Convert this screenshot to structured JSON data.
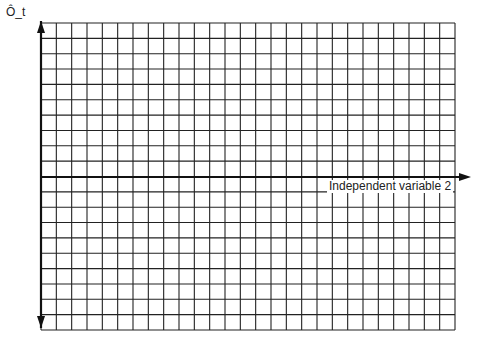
{
  "diagram": {
    "type": "blank-graph-grid",
    "grid": {
      "left": 41,
      "top": 23,
      "right": 455,
      "bottom": 330,
      "columns": 27,
      "rows": 20,
      "line_color": "#222222"
    },
    "axes": {
      "y_axis": {
        "label": "Ô_t",
        "x": 41,
        "arrow_up": true,
        "arrow_down": true
      },
      "x_axis": {
        "label": "Independent variable 2",
        "y": 177,
        "arrow_right": true
      }
    }
  }
}
